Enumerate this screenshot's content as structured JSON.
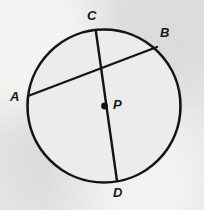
{
  "figure": {
    "kind": "circle-geometry-diagram",
    "background_color": "#e9e9e7",
    "interior_color": "#ececea",
    "stroke_color": "#141414",
    "label_color": "#171717",
    "circle": {
      "cx": 104,
      "cy": 106,
      "r": 76.5,
      "stroke_width": 2.6
    },
    "center_point": {
      "cx": 104.5,
      "cy": 106,
      "r": 3.4
    },
    "segments": [
      {
        "name": "diameter-CD",
        "x1": 96,
        "y1": 32,
        "x2": 117,
        "y2": 181,
        "stroke_width": 2.4
      },
      {
        "name": "chord-AB",
        "x1": 28,
        "y1": 96,
        "x2": 157,
        "y2": 47,
        "stroke_width": 2.4
      }
    ],
    "labels": [
      {
        "id": "label-C",
        "text": "C",
        "x": 87,
        "y": 9
      },
      {
        "id": "label-B",
        "text": "B",
        "x": 160,
        "y": 26
      },
      {
        "id": "label-A",
        "text": "A",
        "x": 10,
        "y": 90
      },
      {
        "id": "label-P",
        "text": "P",
        "x": 113,
        "y": 98
      },
      {
        "id": "label-D",
        "text": "D",
        "x": 113,
        "y": 186
      }
    ]
  }
}
